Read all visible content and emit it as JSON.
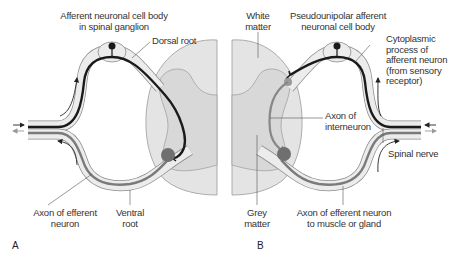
{
  "figure": {
    "panels": [
      {
        "letter": "A",
        "labels": {
          "cell_body_line1": "Afferent neuronal cell body",
          "cell_body_line2": "in spinal ganglion",
          "dorsal_root": "Dorsal root",
          "efferent_axon_line1": "Axon of efferent",
          "efferent_axon_line2": "neuron",
          "ventral_root_line1": "Ventral",
          "ventral_root_line2": "root"
        }
      },
      {
        "letter": "B",
        "labels": {
          "white_matter_line1": "White",
          "white_matter_line2": "matter",
          "pseudounipolar_line1": "Pseudounipolar afferent",
          "pseudounipolar_line2": "neuronal cell body",
          "cyto_line1": "Cytoplasmic",
          "cyto_line2": "process of",
          "cyto_line3": "afferent neuron",
          "cyto_line4": "(from sensory",
          "cyto_line5": "receptor)",
          "interneuron_line1": "Axon of",
          "interneuron_line2": "interneuron",
          "spinal_nerve": "Spinal nerve",
          "grey_matter_line1": "Grey",
          "grey_matter_line2": "matter",
          "efferent_line1": "Axon of efferent neuron",
          "efferent_line2": "to muscle or gland"
        }
      }
    ],
    "colors": {
      "cord_fill": "#e4e4e4",
      "grey_matter_fill": "#d8d8d8",
      "nerve_sheath": "#ececec",
      "afferent_fiber": "#1a1a1a",
      "efferent_fiber": "#7a7a7a",
      "cell_body": "#6f6f6f"
    }
  }
}
